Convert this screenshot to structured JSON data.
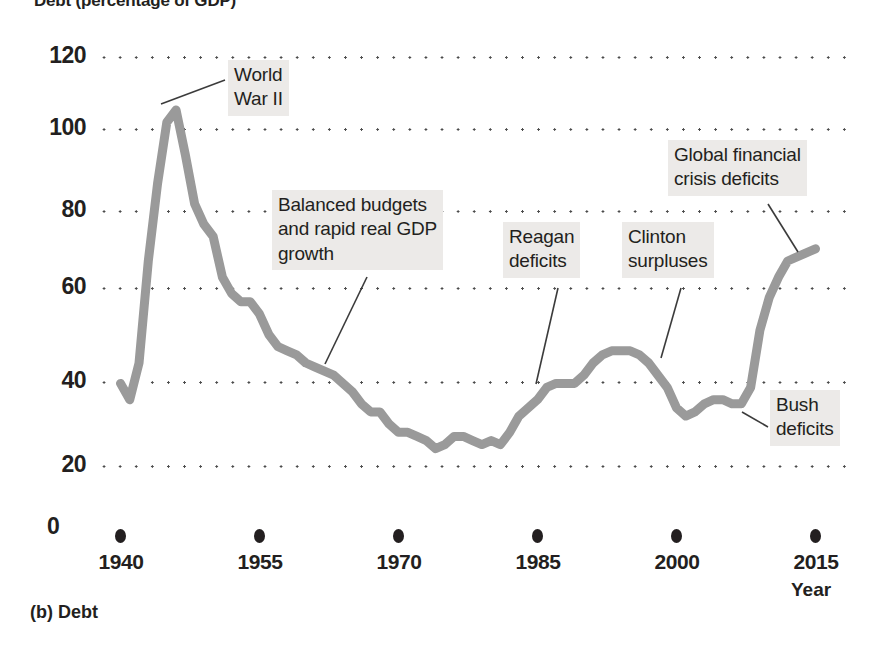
{
  "figure": {
    "title": "Debt (percentage of GDP)",
    "panel_caption": "(b) Debt",
    "axis_name": "Year"
  },
  "chart_data": {
    "type": "line",
    "title": "Debt (percentage of GDP)",
    "xlabel": "Year",
    "ylabel": "Debt (percentage of GDP)",
    "xlim": [
      1940,
      2015
    ],
    "ylim": [
      0,
      120
    ],
    "yticks": [
      0,
      20,
      40,
      60,
      80,
      100,
      120
    ],
    "xticks": [
      1940,
      1955,
      1970,
      1985,
      2000,
      2015
    ],
    "grid": "horizontal-dotted",
    "legend": "none",
    "line_color": "#9a9a9a",
    "series_name": "Federal debt held by the public",
    "x": [
      1940,
      1941,
      1942,
      1943,
      1944,
      1945,
      1946,
      1947,
      1948,
      1949,
      1950,
      1951,
      1952,
      1953,
      1954,
      1955,
      1956,
      1957,
      1958,
      1959,
      1960,
      1961,
      1962,
      1963,
      1964,
      1965,
      1966,
      1967,
      1968,
      1969,
      1970,
      1971,
      1972,
      1973,
      1974,
      1975,
      1976,
      1977,
      1978,
      1979,
      1980,
      1981,
      1982,
      1983,
      1984,
      1985,
      1986,
      1987,
      1988,
      1989,
      1990,
      1991,
      1992,
      1993,
      1994,
      1995,
      1996,
      1997,
      1998,
      1999,
      2000,
      2001,
      2002,
      2003,
      2004,
      2005,
      2006,
      2007,
      2008,
      2009,
      2010,
      2011,
      2012,
      2013,
      2014,
      2015
    ],
    "values": [
      40,
      36,
      45,
      70,
      89,
      104,
      107,
      96,
      84,
      79,
      76,
      66,
      62,
      60,
      60,
      57,
      52,
      49,
      48,
      47,
      45,
      44,
      43,
      42,
      40,
      38,
      35,
      33,
      33,
      30,
      28,
      28,
      27,
      26,
      24,
      25,
      27,
      27,
      26,
      25,
      26,
      25,
      28,
      32,
      34,
      36,
      39,
      40,
      40,
      40,
      42,
      45,
      47,
      48,
      48,
      48,
      47,
      45,
      42,
      39,
      34,
      32,
      33,
      35,
      36,
      36,
      35,
      35,
      39,
      53,
      61,
      66,
      70,
      71,
      72,
      73
    ]
  },
  "annotations": [
    {
      "id": "world-war-ii",
      "text": "World\nWar II"
    },
    {
      "id": "balanced-budgets",
      "text": "Balanced budgets\nand rapid real GDP\ngrowth"
    },
    {
      "id": "reagan-deficits",
      "text": "Reagan\ndeficits"
    },
    {
      "id": "clinton-surpluses",
      "text": "Clinton\nsurpluses"
    },
    {
      "id": "global-financial-crisis",
      "text": "Global financial\ncrisis deficits"
    },
    {
      "id": "bush-deficits",
      "text": "Bush\ndeficits"
    }
  ],
  "y_axis": {
    "ticks": [
      {
        "label": "120"
      },
      {
        "label": "100"
      },
      {
        "label": "80"
      },
      {
        "label": "60"
      },
      {
        "label": "40"
      },
      {
        "label": "20"
      },
      {
        "label": "0"
      }
    ]
  },
  "x_axis": {
    "ticks": [
      {
        "label": "1940"
      },
      {
        "label": "1955"
      },
      {
        "label": "1970"
      },
      {
        "label": "1985"
      },
      {
        "label": "2000"
      },
      {
        "label": "2015"
      }
    ]
  }
}
